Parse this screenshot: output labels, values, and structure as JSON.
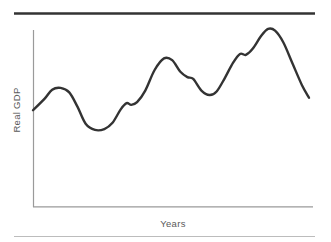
{
  "chart_data": {
    "type": "line",
    "title": "",
    "subtitle": "",
    "xlabel": "Years",
    "ylabel": "Real GDP",
    "grid": false,
    "legend": null,
    "annotations": [],
    "axis_ranges": {
      "x": [
        0,
        100
      ],
      "y": [
        0,
        100
      ]
    },
    "tick_labels": {
      "x": [],
      "y": []
    },
    "series": [
      {
        "name": "Real GDP",
        "color": "#333333",
        "line_width": 2.4,
        "smoothing": "spline",
        "points": [
          {
            "x": 0.0,
            "y": 54.0,
            "phase": "start"
          },
          {
            "x": 5.0,
            "y": 60.5,
            "phase": "expansion"
          },
          {
            "x": 8.2,
            "y": 65.5,
            "phase": "expansion"
          },
          {
            "x": 11.8,
            "y": 66.5,
            "phase": "peak"
          },
          {
            "x": 15.5,
            "y": 64.0,
            "phase": "recession"
          },
          {
            "x": 19.0,
            "y": 56.0,
            "phase": "recession"
          },
          {
            "x": 22.5,
            "y": 46.5,
            "phase": "recession"
          },
          {
            "x": 26.5,
            "y": 43.0,
            "phase": "trough"
          },
          {
            "x": 30.5,
            "y": 43.5,
            "phase": "trough"
          },
          {
            "x": 34.0,
            "y": 47.0,
            "phase": "recovery"
          },
          {
            "x": 37.5,
            "y": 54.5,
            "phase": "expansion"
          },
          {
            "x": 40.0,
            "y": 58.0,
            "phase": "plateau"
          },
          {
            "x": 42.0,
            "y": 57.0,
            "phase": "plateau"
          },
          {
            "x": 44.5,
            "y": 58.5,
            "phase": "expansion"
          },
          {
            "x": 48.0,
            "y": 65.0,
            "phase": "expansion"
          },
          {
            "x": 52.0,
            "y": 76.5,
            "phase": "expansion"
          },
          {
            "x": 56.0,
            "y": 83.0,
            "phase": "peak"
          },
          {
            "x": 59.5,
            "y": 82.0,
            "phase": "peak"
          },
          {
            "x": 63.0,
            "y": 75.5,
            "phase": "recession"
          },
          {
            "x": 66.0,
            "y": 72.5,
            "phase": "shoulder"
          },
          {
            "x": 68.5,
            "y": 71.5,
            "phase": "shoulder"
          },
          {
            "x": 72.0,
            "y": 65.0,
            "phase": "recession"
          },
          {
            "x": 75.5,
            "y": 62.5,
            "phase": "trough"
          },
          {
            "x": 78.5,
            "y": 64.5,
            "phase": "recovery"
          },
          {
            "x": 82.0,
            "y": 72.0,
            "phase": "expansion"
          },
          {
            "x": 85.5,
            "y": 80.5,
            "phase": "expansion"
          },
          {
            "x": 88.5,
            "y": 85.5,
            "phase": "plateau"
          },
          {
            "x": 91.0,
            "y": 85.0,
            "phase": "plateau"
          },
          {
            "x": 94.0,
            "y": 88.5,
            "phase": "expansion"
          },
          {
            "x": 97.5,
            "y": 95.5,
            "phase": "expansion"
          },
          {
            "x": 100.5,
            "y": 99.5,
            "phase": "peak"
          },
          {
            "x": 103.5,
            "y": 98.5,
            "phase": "peak"
          },
          {
            "x": 107.0,
            "y": 92.0,
            "phase": "recession"
          },
          {
            "x": 111.0,
            "y": 80.0,
            "phase": "recession"
          },
          {
            "x": 115.0,
            "y": 68.0,
            "phase": "recession"
          },
          {
            "x": 118.0,
            "y": 61.0,
            "phase": "end"
          }
        ]
      }
    ]
  },
  "figure": {
    "background_color": "#ffffff",
    "curve_color": "#333333",
    "axis_color": "#9a9a9a",
    "label_color": "#5a5a5a",
    "top_rule_color": "#333333",
    "bottom_rule_color": "#b8b8b8",
    "ylabel": "Real GDP",
    "xlabel": "Years"
  }
}
